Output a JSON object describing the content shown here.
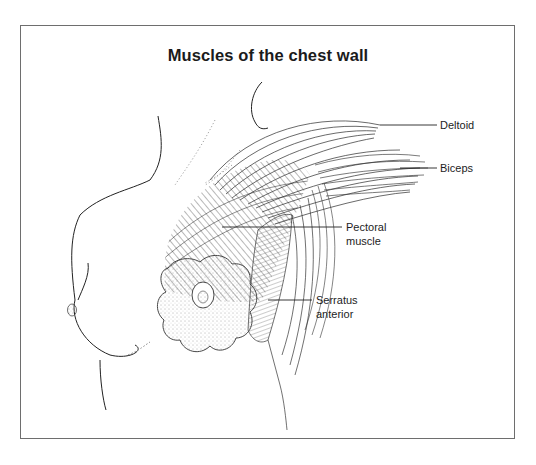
{
  "figure": {
    "title": "Muscles of the chest wall",
    "labels": {
      "deltoid": "Deltoid",
      "biceps": "Biceps",
      "pectoral_line1": "Pectoral",
      "pectoral_line2": "muscle",
      "serratus_line1": "Serratus",
      "serratus_line2": "anterior"
    },
    "colors": {
      "ink": "#1d1d1d",
      "frame": "#6e6e6e",
      "background": "#ffffff"
    }
  }
}
